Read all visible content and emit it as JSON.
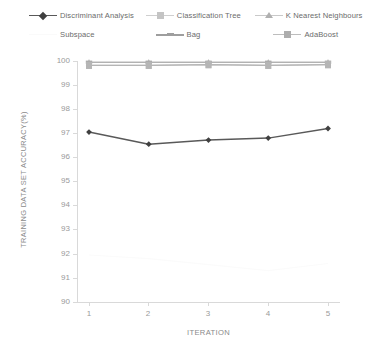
{
  "chart_data": {
    "type": "line",
    "title": "",
    "xlabel": "ITERATION",
    "ylabel": "TRAINING DATA SET ACCURACY(%)",
    "x": [
      1,
      2,
      3,
      4,
      5
    ],
    "xtick_labels": [
      "1",
      "2",
      "3",
      "4",
      "5"
    ],
    "ytick_labels": [
      "100",
      "99",
      "98",
      "97",
      "96",
      "95",
      "94",
      "93",
      "92",
      "91",
      "90"
    ],
    "ylim": [
      90,
      100
    ],
    "ytick_step": 1,
    "xlim": [
      1,
      5
    ],
    "grid": false,
    "legend_position": "top",
    "series": [
      {
        "name": "Discriminant Analysis",
        "values": [
          97.05,
          96.55,
          96.72,
          96.8,
          97.2
        ],
        "color": "#595959",
        "marker": "diamond"
      },
      {
        "name": "Classification Tree",
        "values": [
          99.82,
          99.82,
          99.85,
          99.82,
          99.85
        ],
        "color": "#c9c9c9",
        "marker": "square"
      },
      {
        "name": "K Nearest Neighbours",
        "values": [
          99.95,
          99.95,
          99.95,
          99.95,
          99.95
        ],
        "color": "#bdbdbd",
        "marker": "triangle"
      },
      {
        "name": "Subspace",
        "values": [
          91.95,
          91.8,
          91.55,
          91.3,
          91.6
        ],
        "color": "#fbfbfb",
        "marker": "none"
      },
      {
        "name": "Bag",
        "values": [
          99.95,
          99.95,
          99.95,
          99.95,
          99.95
        ],
        "color": "#a8a8a8",
        "marker": "line"
      },
      {
        "name": "AdaBoost",
        "values": [
          99.82,
          99.82,
          99.85,
          99.82,
          99.85
        ],
        "color": "#b5b5b5",
        "marker": "square"
      }
    ]
  },
  "legend": {
    "rows": [
      [
        {
          "label": "Discriminant Analysis"
        },
        {
          "label": "Classification Tree"
        },
        {
          "label": "K Nearest Neighbours"
        }
      ],
      [
        {
          "label": "Subspace"
        },
        {
          "label": "Bag"
        },
        {
          "label": "AdaBoost"
        }
      ]
    ]
  }
}
